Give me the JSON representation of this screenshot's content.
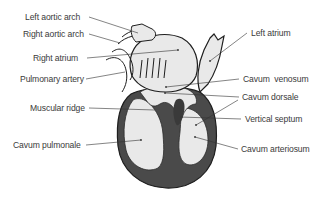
{
  "diagram": {
    "labels_left": [
      {
        "id": "left-aortic-arch",
        "text": "Left aortic arch",
        "x": 23,
        "y": 13
      },
      {
        "id": "right-aortic-arch",
        "text": "Right aortic arch",
        "x": 22,
        "y": 30
      },
      {
        "id": "right-atrium",
        "text": "Right atrium",
        "x": 33,
        "y": 54
      },
      {
        "id": "pulmonary-artery",
        "text": "Pulmonary artery",
        "x": 19,
        "y": 75
      },
      {
        "id": "muscular-ridge",
        "text": "Muscular ridge",
        "x": 30,
        "y": 103
      },
      {
        "id": "cavum-pulmonale",
        "text": "Cavum pulmonale",
        "x": 13,
        "y": 141
      }
    ],
    "labels_right": [
      {
        "id": "left-atrium",
        "text": "Left atrium",
        "x": 251,
        "y": 29
      },
      {
        "id": "cavum-venosum",
        "text": "Cavum  venosum",
        "x": 243,
        "y": 75
      },
      {
        "id": "cavum-dorsale",
        "text": "Cavum dorsale",
        "x": 242,
        "y": 93
      },
      {
        "id": "vertical-septum",
        "text": "Vertical septum",
        "x": 245,
        "y": 115
      },
      {
        "id": "cavum-arteriosum",
        "text": "Cavum arteriosum",
        "x": 241,
        "y": 144
      }
    ],
    "colors": {
      "outline": "#1e1e1e",
      "fill_light": "#e9e9e9",
      "muscle_dark": "#4a4a4a",
      "leader_line": "#333333",
      "label_text": "#3a3a3a"
    }
  }
}
